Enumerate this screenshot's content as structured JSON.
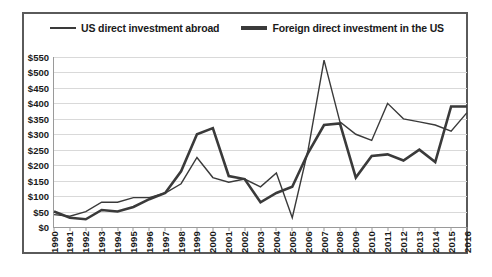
{
  "chart_data": {
    "type": "line",
    "title": "",
    "xlabel": "",
    "ylabel": "",
    "x": [
      1990,
      1991,
      1992,
      1993,
      1994,
      1995,
      1996,
      1997,
      1998,
      1999,
      2000,
      2001,
      2002,
      2003,
      2004,
      2005,
      2006,
      2007,
      2008,
      2009,
      2010,
      2011,
      2012,
      2013,
      2014,
      2015,
      2016
    ],
    "categories": [
      "1990",
      "1991",
      "1992",
      "1993",
      "1994",
      "1995",
      "1996",
      "1997",
      "1998",
      "1999",
      "2000",
      "2001",
      "2002",
      "2003",
      "2004",
      "2005",
      "2006",
      "2007",
      "2008",
      "2009",
      "2010",
      "2011",
      "2012",
      "2013",
      "2014",
      "2015",
      "2016"
    ],
    "ytick_labels": [
      "$550",
      "$500",
      "$450",
      "$400",
      "$350",
      "$300",
      "$250",
      "$200",
      "$150",
      "$100",
      "$50",
      "$0"
    ],
    "ytick_values": [
      550,
      500,
      450,
      400,
      350,
      300,
      250,
      200,
      150,
      100,
      50,
      0
    ],
    "ylim": [
      0,
      550
    ],
    "grid": true,
    "legend_position": "top",
    "value_prefix": "$",
    "series": [
      {
        "name": "US direct investment abroad",
        "style": "thin",
        "color": "#3a3a3a",
        "values": [
          40,
          35,
          50,
          80,
          80,
          95,
          95,
          110,
          140,
          225,
          160,
          145,
          155,
          130,
          175,
          30,
          250,
          540,
          340,
          300,
          280,
          400,
          350,
          340,
          330,
          310,
          370
        ]
      },
      {
        "name": "Foreign direct investment in the US",
        "style": "thick",
        "color": "#3a3a3a",
        "values": [
          50,
          30,
          25,
          55,
          50,
          65,
          90,
          110,
          180,
          300,
          320,
          165,
          155,
          80,
          110,
          130,
          240,
          330,
          335,
          160,
          230,
          235,
          215,
          250,
          210,
          390,
          390
        ]
      }
    ]
  },
  "legend": {
    "entries": [
      {
        "label": "US direct investment abroad",
        "style": "thin"
      },
      {
        "label": "Foreign direct investment in the US",
        "style": "thick"
      }
    ]
  }
}
